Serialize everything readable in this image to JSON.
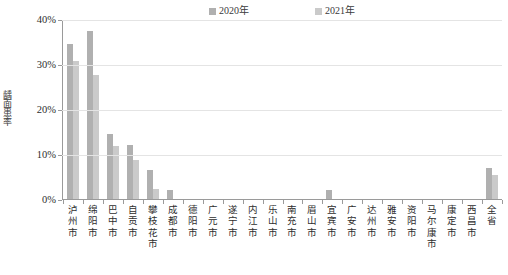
{
  "legend": {
    "position": "top-center",
    "items": [
      {
        "label": "2020年",
        "color": "#b0b0b0"
      },
      {
        "label": "2021年",
        "color": "#cacaca"
      }
    ]
  },
  "axes": {
    "ylabel": "龋面患率",
    "xlabel": "",
    "yticks": [
      "0%",
      "10%",
      "20%",
      "30%",
      "40%"
    ],
    "ymin": 0,
    "ymax": 40
  },
  "chart_data": {
    "type": "bar",
    "title": "",
    "xlabel": "",
    "ylabel": "龋面患率",
    "ylim": [
      0,
      40
    ],
    "ytick_values": [
      0,
      10,
      20,
      30,
      40
    ],
    "ytick_labels": [
      "0%",
      "10%",
      "20%",
      "30%",
      "40%"
    ],
    "grid": true,
    "legend_position": "top-center",
    "units": "percent",
    "categories": [
      "泸州市",
      "绵阳市",
      "巴中市",
      "自贡市",
      "攀枝花市",
      "成都市",
      "德阳市",
      "广元市",
      "遂宁市",
      "内江市",
      "乐山市",
      "南充市",
      "眉山市",
      "宜宾市",
      "广安市",
      "达州市",
      "雅安市",
      "资阳市",
      "马尔康市",
      "康定市",
      "西昌市",
      "全省"
    ],
    "series": [
      {
        "name": "2020年",
        "color": "#b0b0b0",
        "values": [
          34.7,
          37.5,
          14.5,
          12.0,
          6.4,
          2.1,
          0,
          0,
          0,
          0,
          0,
          0,
          0,
          2.0,
          0,
          0,
          0,
          0,
          0,
          0,
          0,
          7.0
        ]
      },
      {
        "name": "2021年",
        "color": "#cacaca",
        "values": [
          30.8,
          27.8,
          11.9,
          8.8,
          2.3,
          0,
          0,
          0,
          0,
          0,
          0,
          0,
          0,
          0,
          0,
          0,
          0,
          0,
          0,
          0,
          0,
          5.4
        ]
      }
    ]
  }
}
